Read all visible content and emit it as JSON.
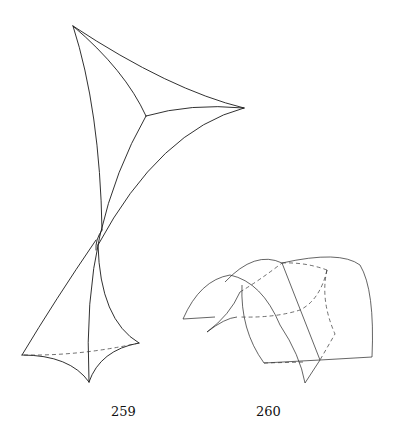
{
  "figures": [
    {
      "id": "fig-259",
      "label": "259",
      "description": "Curved tetrahedral surface figure with cusps, pinched at middle"
    },
    {
      "id": "fig-260",
      "label": "260",
      "description": "Arched folded surface with dashed hidden edges"
    }
  ],
  "colors": {
    "background": "#ffffff",
    "ink": "#1a1a1a"
  }
}
